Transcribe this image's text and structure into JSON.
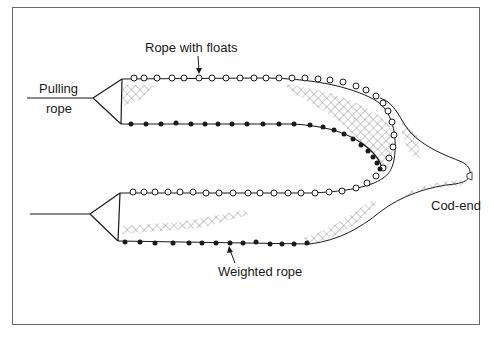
{
  "diagram": {
    "type": "seine net schematic",
    "labels": {
      "rope_with_floats": "Rope with floats",
      "pulling_rope_line1": "Pulling",
      "pulling_rope_line2": "rope",
      "weighted_rope": "Weighted rope",
      "cod_end": "Cod-end"
    },
    "colors": {
      "line": "#1a1a1a",
      "mesh": "#6e6e6e",
      "frame": "#6a6a6a",
      "background": "#ffffff"
    }
  }
}
